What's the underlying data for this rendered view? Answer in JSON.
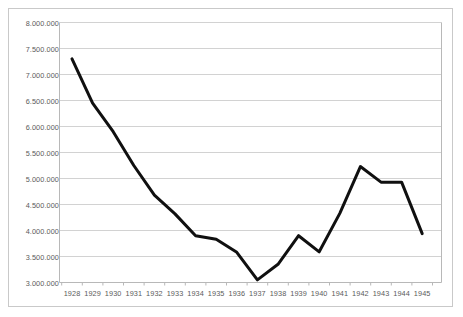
{
  "chart_data": {
    "type": "line",
    "title": "",
    "xlabel": "",
    "ylabel": "",
    "categories": [
      "1928",
      "1929",
      "1930",
      "1931",
      "1932",
      "1933",
      "1934",
      "1935",
      "1936",
      "1937",
      "1938",
      "1939",
      "1940",
      "1941",
      "1942",
      "1943",
      "1944",
      "1945"
    ],
    "values": [
      7300000,
      6450000,
      5900000,
      5250000,
      4680000,
      4320000,
      3900000,
      3830000,
      3580000,
      3050000,
      3350000,
      3900000,
      3590000,
      4330000,
      5230000,
      4930000,
      4930000,
      3940000
    ],
    "series": [
      {
        "name": "series-1",
        "values": [
          7300000,
          6450000,
          5900000,
          5250000,
          4680000,
          4320000,
          3900000,
          3830000,
          3580000,
          3050000,
          3350000,
          3900000,
          3590000,
          4330000,
          5230000,
          4930000,
          4930000,
          3940000
        ]
      }
    ],
    "ylim": [
      3000000,
      8000000
    ],
    "ytick_values": [
      3000000,
      3500000,
      4000000,
      4500000,
      5000000,
      5500000,
      6000000,
      6500000,
      7000000,
      7500000,
      8000000
    ],
    "ytick_labels": [
      "3.000.000",
      "3.500.000",
      "4.000.000",
      "4.500.000",
      "5.000.000",
      "5.500.000",
      "6.000.000",
      "6.500.000",
      "7.000.000",
      "7.500.000",
      "8.000.000"
    ],
    "xtick_labels": [
      "1928",
      "1929",
      "1930",
      "1931",
      "1932",
      "1933",
      "1934",
      "1935",
      "1936",
      "1937",
      "1938",
      "1939",
      "1940",
      "1941",
      "1942",
      "1943",
      "1944",
      "1945"
    ],
    "grid": true,
    "grid_axis": "y",
    "legend": false,
    "legend_position": "none",
    "colors": {
      "line": "#101010",
      "grid": "#d2d2d2",
      "axis": "#b8b8b8",
      "tick_text": "#5b5b5b",
      "plot_background": "#ffffff",
      "frame_border": "#c9c9c9"
    },
    "line_width": 3,
    "annotations": []
  }
}
